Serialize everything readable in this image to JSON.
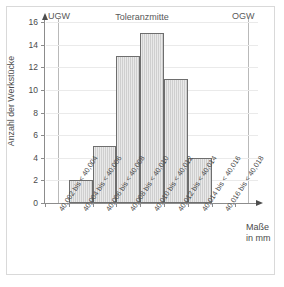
{
  "chart_data": {
    "type": "bar",
    "title": "",
    "xlabel": "Maße in mm",
    "ylabel": "Anzahl der Werkstücke",
    "categories": [
      "40,002 bis < 40,004",
      "40,004 bis < 40,006",
      "40,006 bis < 40,008",
      "40,008 bis < 40,010",
      "40,010 bis < 40,012",
      "40,012 bis < 40,014",
      "40,014 bis < 40,016",
      "40,016 bis < 40,018"
    ],
    "values": [
      0,
      2,
      5,
      13,
      15,
      11,
      4,
      0
    ],
    "ylim": [
      0,
      16
    ],
    "yticks": [
      0,
      2,
      4,
      6,
      8,
      10,
      12,
      14,
      16
    ],
    "ytick_labels": [
      "0",
      "2",
      "4",
      "6",
      "8",
      "10",
      "12",
      "14",
      "16"
    ],
    "grid": true,
    "legend": "none",
    "annotations": [
      {
        "key": "lower_limit",
        "label": "UGW"
      },
      {
        "key": "tolerance_center",
        "label": "Toleranzmitte"
      },
      {
        "key": "upper_limit",
        "label": "OGW"
      }
    ],
    "bar_fill_color": "#cfcfcf",
    "bar_edge_color": "#6e6e6e",
    "grid_color": "#eaeaea",
    "axis_color": "#8c8c8c"
  },
  "axis": {
    "x_title_line1": "Maße",
    "x_title_line2": "in mm",
    "y_title": "Anzahl der Werkstücke"
  },
  "limits": {
    "lower": "UGW",
    "center": "Toleranzmitte",
    "upper": "OGW"
  }
}
